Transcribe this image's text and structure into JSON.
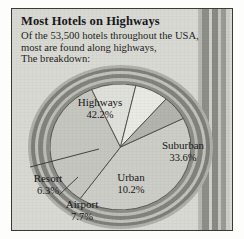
{
  "header": {
    "title": "Most Hotels on Highways",
    "line1": "Of the 53,500 hotels throughout the USA,",
    "line2": "most are found along highways,",
    "line3": "The breakdown:"
  },
  "chart_data": {
    "type": "pie",
    "title": "Most Hotels on Highways",
    "subtitle": "Of the 53,500 hotels throughout the USA, most are found along highways, The breakdown:",
    "total_hotels": "53,500",
    "unit": "%",
    "categories": [
      "Highways",
      "Suburban",
      "Urban",
      "Airport",
      "Resort"
    ],
    "values": [
      42.2,
      33.6,
      10.2,
      7.7,
      6.3
    ],
    "slices": [
      {
        "name": "Highways",
        "percent": "42.2%",
        "value": 42.2,
        "color": "#cdcdc7"
      },
      {
        "name": "Suburban",
        "percent": "33.6%",
        "value": 33.6,
        "color": "#c6c6c0"
      },
      {
        "name": "Urban",
        "percent": "10.2%",
        "value": 10.2,
        "color": "#e0e0da"
      },
      {
        "name": "Airport",
        "percent": "7.7%",
        "value": 7.7,
        "color": "#eaeae4"
      },
      {
        "name": "Resort",
        "percent": "6.3%",
        "value": 6.3,
        "color": "#b4b4ae"
      }
    ],
    "legend": "labels on slices",
    "grid": false
  },
  "colors": {
    "panel_background": "#d9d9d4",
    "frame": "#3a3a38",
    "road_dark": "#7f7f79",
    "road_light": "#c2c2bc",
    "text": "#16161a"
  }
}
